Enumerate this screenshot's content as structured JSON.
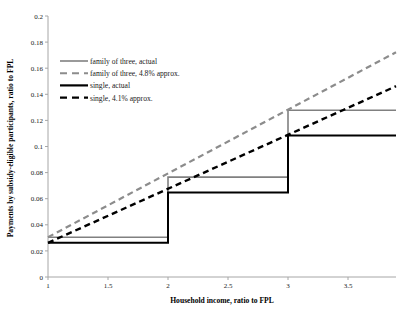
{
  "chart_data": {
    "type": "line",
    "title": "",
    "xlabel": "Household income, ratio to FPL",
    "ylabel": "Payments by subsidy-eligible participants, ratio to FPL",
    "xlim": [
      1,
      3.9
    ],
    "ylim": [
      0,
      0.2
    ],
    "grid": false,
    "legend_position": "upper-left-inside",
    "xticks": [
      "1",
      "1.5",
      "2",
      "2.5",
      "3",
      "3.5"
    ],
    "xtick_values": [
      1,
      1.5,
      2,
      2.5,
      3,
      3.5
    ],
    "yticks": [
      "0",
      "0.02",
      "0.04",
      "0.06",
      "0.08",
      "0.1",
      "0.12",
      "0.14",
      "0.16",
      "0.18",
      "0.2"
    ],
    "ytick_values": [
      0,
      0.02,
      0.04,
      0.06,
      0.08,
      0.1,
      0.12,
      0.14,
      0.16,
      0.18,
      0.2
    ],
    "series": [
      {
        "name": "family of three, actual",
        "style": "solid",
        "color": "#808080",
        "width": 1.6,
        "shape": "step",
        "x": [
          1,
          2,
          2,
          3,
          3,
          3.9
        ],
        "values": [
          0.0305,
          0.0305,
          0.0765,
          0.0765,
          0.1278,
          0.1278
        ]
      },
      {
        "name": "family of three, 4.8% approx.",
        "style": "dashed",
        "color": "#8c8c8c",
        "width": 2.2,
        "shape": "line",
        "x": [
          1,
          3.9
        ],
        "values": [
          0.0305,
          0.1722
        ]
      },
      {
        "name": "single, actual",
        "style": "solid",
        "color": "#000000",
        "width": 2.0,
        "shape": "step",
        "x": [
          1,
          2,
          2,
          3,
          3,
          3.9
        ],
        "values": [
          0.0262,
          0.0262,
          0.0648,
          0.0648,
          0.1085,
          0.1085
        ]
      },
      {
        "name": "single, 4.1% approx.",
        "style": "dashed",
        "color": "#000000",
        "width": 2.4,
        "shape": "line",
        "x": [
          1,
          3.9
        ],
        "values": [
          0.0262,
          0.1462
        ]
      }
    ],
    "legend": [
      {
        "label": "family of three, actual",
        "color": "#808080",
        "style": "solid",
        "width": 1.6
      },
      {
        "label": "family of three, 4.8% approx.",
        "color": "#8c8c8c",
        "style": "dashed",
        "width": 2.0
      },
      {
        "label": "single, actual",
        "color": "#000000",
        "style": "solid",
        "width": 2.2
      },
      {
        "label": "single, 4.1% approx.",
        "color": "#000000",
        "style": "dashed",
        "width": 2.4
      }
    ]
  }
}
